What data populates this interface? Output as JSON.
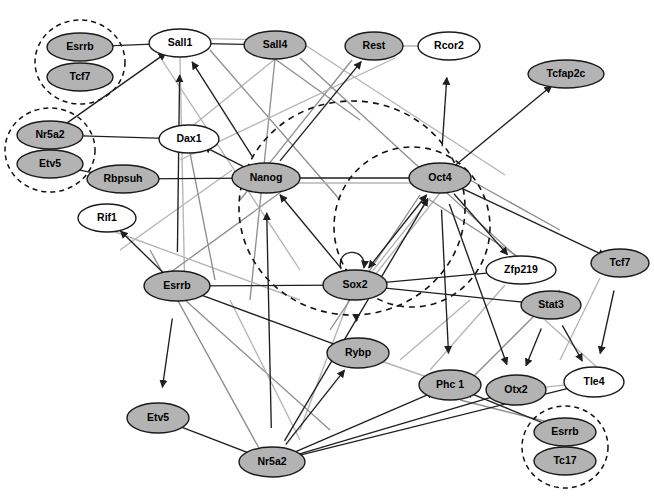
{
  "figure": {
    "type": "directed-network-graph",
    "title": "",
    "width": 654,
    "height": 499,
    "background": "#ffffff",
    "node_fill_gray": "#b3b3b3",
    "node_fill_white": "#ffffff",
    "node_stroke": "#1a1a1a",
    "edge_dark_color": "#1f1f1f",
    "edge_light_color": "#b5b5b5"
  },
  "nodes": [
    {
      "id": "esrrb_tl",
      "label": "Esrrb",
      "x": 80,
      "y": 47,
      "rx": 33,
      "ry": 14,
      "fill": "gray"
    },
    {
      "id": "tcf7_tl",
      "label": "Tcf7",
      "x": 80,
      "y": 77,
      "rx": 33,
      "ry": 14,
      "fill": "gray"
    },
    {
      "id": "sall1",
      "label": "Sall1",
      "x": 180,
      "y": 43,
      "rx": 31,
      "ry": 14,
      "fill": "white"
    },
    {
      "id": "sall4",
      "label": "Sall4",
      "x": 275,
      "y": 45,
      "rx": 31,
      "ry": 14,
      "fill": "gray"
    },
    {
      "id": "rest",
      "label": "Rest",
      "x": 374,
      "y": 46,
      "rx": 29,
      "ry": 14,
      "fill": "gray"
    },
    {
      "id": "rcor2",
      "label": "Rcor2",
      "x": 449,
      "y": 46,
      "rx": 31,
      "ry": 14,
      "fill": "white"
    },
    {
      "id": "tcfap2c",
      "label": "Tcfap2c",
      "x": 566,
      "y": 74,
      "rx": 38,
      "ry": 14,
      "fill": "gray"
    },
    {
      "id": "nr5a2_tl",
      "label": "Nr5a2",
      "x": 50,
      "y": 135,
      "rx": 33,
      "ry": 14,
      "fill": "gray"
    },
    {
      "id": "etv5_tl",
      "label": "Etv5",
      "x": 50,
      "y": 164,
      "rx": 33,
      "ry": 14,
      "fill": "gray"
    },
    {
      "id": "dax1",
      "label": "Dax1",
      "x": 189,
      "y": 139,
      "rx": 30,
      "ry": 14,
      "fill": "white"
    },
    {
      "id": "rbpsuh",
      "label": "Rbpsuh",
      "x": 123,
      "y": 179,
      "rx": 36,
      "ry": 14,
      "fill": "gray"
    },
    {
      "id": "nanog",
      "label": "Nanog",
      "x": 266,
      "y": 178,
      "rx": 34,
      "ry": 15,
      "fill": "gray"
    },
    {
      "id": "oct4",
      "label": "Oct4",
      "x": 440,
      "y": 178,
      "rx": 31,
      "ry": 15,
      "fill": "gray"
    },
    {
      "id": "rif1",
      "label": "Rif1",
      "x": 107,
      "y": 218,
      "rx": 29,
      "ry": 14,
      "fill": "white"
    },
    {
      "id": "tcf7_r",
      "label": "Tcf7",
      "x": 620,
      "y": 263,
      "rx": 29,
      "ry": 14,
      "fill": "gray"
    },
    {
      "id": "zfp219",
      "label": "Zfp219",
      "x": 521,
      "y": 270,
      "rx": 35,
      "ry": 14,
      "fill": "white"
    },
    {
      "id": "esrrb_l",
      "label": "Esrrb",
      "x": 177,
      "y": 286,
      "rx": 33,
      "ry": 15,
      "fill": "gray"
    },
    {
      "id": "sox2",
      "label": "Sox2",
      "x": 355,
      "y": 285,
      "rx": 32,
      "ry": 15,
      "fill": "gray"
    },
    {
      "id": "stat3",
      "label": "Stat3",
      "x": 551,
      "y": 305,
      "rx": 30,
      "ry": 14,
      "fill": "gray"
    },
    {
      "id": "rybp",
      "label": "Rybp",
      "x": 358,
      "y": 353,
      "rx": 31,
      "ry": 15,
      "fill": "gray"
    },
    {
      "id": "phc1",
      "label": "Phc 1",
      "x": 450,
      "y": 385,
      "rx": 31,
      "ry": 15,
      "fill": "gray"
    },
    {
      "id": "otx2",
      "label": "Otx2",
      "x": 516,
      "y": 390,
      "rx": 30,
      "ry": 15,
      "fill": "gray"
    },
    {
      "id": "tle4",
      "label": "Tle4",
      "x": 594,
      "y": 382,
      "rx": 30,
      "ry": 15,
      "fill": "white"
    },
    {
      "id": "etv5_b",
      "label": "Etv5",
      "x": 158,
      "y": 418,
      "rx": 31,
      "ry": 15,
      "fill": "gray"
    },
    {
      "id": "nr5a2_b",
      "label": "Nr5a2",
      "x": 272,
      "y": 462,
      "rx": 33,
      "ry": 15,
      "fill": "gray"
    },
    {
      "id": "esrrb_br",
      "label": "Esrrb",
      "x": 565,
      "y": 432,
      "rx": 31,
      "ry": 14,
      "fill": "gray"
    },
    {
      "id": "tc17_br",
      "label": "Tc17",
      "x": 565,
      "y": 461,
      "rx": 31,
      "ry": 14,
      "fill": "gray"
    }
  ],
  "group_ellipses": [
    {
      "id": "group-esrrb-tcf7",
      "x": 80,
      "y": 62,
      "rx": 45,
      "ry": 42,
      "members": [
        "Esrrb",
        "Tcf7"
      ]
    },
    {
      "id": "group-nr5a2-etv5",
      "x": 50,
      "y": 150,
      "rx": 45,
      "ry": 42,
      "members": [
        "Nr5a2",
        "Etv5"
      ]
    },
    {
      "id": "group-esrrb-tc17",
      "x": 565,
      "y": 447,
      "rx": 43,
      "ry": 41,
      "members": [
        "Esrrb",
        "Tc17"
      ]
    }
  ],
  "core_circles": [
    {
      "id": "core-circle-outer",
      "x": 352,
      "y": 208,
      "rx": 113,
      "ry": 107,
      "members": [
        "Nanog",
        "Oct4",
        "Sox2"
      ]
    },
    {
      "id": "core-circle-inner",
      "x": 412,
      "y": 227,
      "rx": 78,
      "ry": 80,
      "members": [
        "Oct4",
        "Sox2"
      ]
    }
  ],
  "self_loops": [
    {
      "id": "sox2-self-loop",
      "node": "sox2"
    }
  ],
  "edges": [
    {
      "from": "esrrb_tl",
      "to": "sall1",
      "style": "dark",
      "arrow": "forward"
    },
    {
      "from": "nr5a2_tl",
      "to": "sall1",
      "style": "dark",
      "arrow": "forward"
    },
    {
      "from": "nr5a2_tl",
      "to": "dax1",
      "style": "dark",
      "arrow": "forward"
    },
    {
      "from": "etv5_tl",
      "to": "rbpsuh",
      "style": "dark",
      "arrow": "forward"
    },
    {
      "from": "sall4",
      "to": "sall1",
      "style": "dark",
      "arrow": "forward"
    },
    {
      "from": "sall4",
      "to": "sall1",
      "style": "light",
      "arrow": "none"
    },
    {
      "from": "nanog",
      "to": "sall1",
      "style": "dark",
      "arrow": "forward"
    },
    {
      "from": "nanog",
      "to": "dax1",
      "style": "dark",
      "arrow": "forward"
    },
    {
      "from": "nanog",
      "to": "rbpsuh",
      "style": "dark",
      "arrow": "forward"
    },
    {
      "from": "nanog",
      "to": "oct4",
      "style": "dark",
      "arrow": "both"
    },
    {
      "from": "nanog",
      "to": "oct4",
      "style": "light",
      "arrow": "none"
    },
    {
      "from": "nanog",
      "to": "rest",
      "style": "dark",
      "arrow": "forward"
    },
    {
      "from": "oct4",
      "to": "rcor2",
      "style": "dark",
      "arrow": "forward"
    },
    {
      "from": "oct4",
      "to": "tcfap2c",
      "style": "dark",
      "arrow": "forward"
    },
    {
      "from": "rest",
      "to": "rcor2",
      "style": "light",
      "arrow": "none"
    },
    {
      "from": "sox2",
      "to": "nanog",
      "style": "dark",
      "arrow": "forward"
    },
    {
      "from": "sox2",
      "to": "oct4",
      "style": "dark",
      "arrow": "both"
    },
    {
      "from": "sox2",
      "to": "oct4",
      "style": "light",
      "arrow": "none"
    },
    {
      "from": "sox2",
      "to": "sox2",
      "style": "dark",
      "arrow": "forward"
    },
    {
      "from": "esrrb_l",
      "to": "sox2",
      "style": "dark",
      "arrow": "forward"
    },
    {
      "from": "esrrb_l",
      "to": "rybp",
      "style": "dark",
      "arrow": "forward"
    },
    {
      "from": "esrrb_l",
      "to": "etv5_b",
      "style": "dark",
      "arrow": "forward"
    },
    {
      "from": "esrrb_l",
      "to": "rif1",
      "style": "dark",
      "arrow": "forward"
    },
    {
      "from": "esrrb_l",
      "to": "sall1",
      "style": "dark",
      "arrow": "forward"
    },
    {
      "from": "sox2",
      "to": "rybp",
      "style": "dark",
      "arrow": "forward"
    },
    {
      "from": "stat3",
      "to": "otx2",
      "style": "dark",
      "arrow": "forward"
    },
    {
      "from": "stat3",
      "to": "tle4",
      "style": "dark",
      "arrow": "forward"
    },
    {
      "from": "stat3",
      "to": "sox2",
      "style": "dark",
      "arrow": "forward"
    },
    {
      "from": "tcf7_r",
      "to": "tle4",
      "style": "dark",
      "arrow": "forward"
    },
    {
      "from": "oct4",
      "to": "tcf7_r",
      "style": "dark",
      "arrow": "forward"
    },
    {
      "from": "oct4",
      "to": "zfp219",
      "style": "dark",
      "arrow": "forward"
    },
    {
      "from": "oct4",
      "to": "phc1",
      "style": "dark",
      "arrow": "forward"
    },
    {
      "from": "oct4",
      "to": "otx2",
      "style": "dark",
      "arrow": "forward"
    },
    {
      "from": "nr5a2_b",
      "to": "rybp",
      "style": "dark",
      "arrow": "forward"
    },
    {
      "from": "nr5a2_b",
      "to": "etv5_b",
      "style": "dark",
      "arrow": "forward"
    },
    {
      "from": "nr5a2_b",
      "to": "phc1",
      "style": "dark",
      "arrow": "forward"
    },
    {
      "from": "nr5a2_b",
      "to": "otx2",
      "style": "dark",
      "arrow": "forward"
    },
    {
      "from": "nr5a2_b",
      "to": "tle4",
      "style": "dark",
      "arrow": "forward"
    },
    {
      "from": "nr5a2_b",
      "to": "oct4",
      "style": "dark",
      "arrow": "forward"
    },
    {
      "from": "nr5a2_b",
      "to": "nanog",
      "style": "dark",
      "arrow": "forward"
    },
    {
      "from": "esrrb_br",
      "to": "phc1",
      "style": "dark",
      "arrow": "forward"
    },
    {
      "from": "rybp",
      "to": "phc1",
      "style": "light",
      "arrow": "none"
    },
    {
      "from": "otx2",
      "to": "tle4",
      "style": "light",
      "arrow": "none"
    },
    {
      "from": "zfp219",
      "to": "sox2",
      "style": "dark",
      "arrow": "none"
    }
  ],
  "legend": {
    "present": false
  }
}
